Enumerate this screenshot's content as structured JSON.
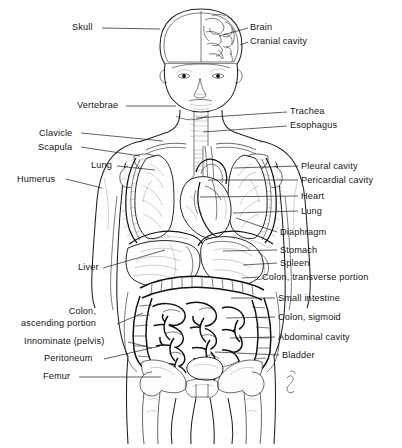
{
  "figure": {
    "orientation": "anterior view",
    "line_color": "#1c1c1c",
    "background_color": "#ffffff",
    "text_color": "#161616"
  },
  "labels_left": [
    {
      "id": "skull",
      "text": "Skull",
      "x": 72,
      "y": 22,
      "lead_to_x": 160,
      "lead_to_y": 29,
      "lead_from_x": 102,
      "lead_from_y": 28
    },
    {
      "id": "vertebrae",
      "text": "Vertebrae",
      "x": 77,
      "y": 100,
      "lead_to_x": 176,
      "lead_to_y": 106,
      "lead_from_x": 126,
      "lead_from_y": 106
    },
    {
      "id": "clavicle",
      "text": "Clavicle",
      "x": 39,
      "y": 128,
      "lead_to_x": 163,
      "lead_to_y": 141,
      "lead_from_x": 81,
      "lead_from_y": 133
    },
    {
      "id": "scapula",
      "text": "Scapula",
      "x": 38,
      "y": 142,
      "lead_to_x": 140,
      "lead_to_y": 156,
      "lead_from_x": 81,
      "lead_from_y": 147
    },
    {
      "id": "lung-left",
      "text": "Lung",
      "x": 91,
      "y": 160,
      "lead_to_x": 155,
      "lead_to_y": 170,
      "lead_from_x": 117,
      "lead_from_y": 166
    },
    {
      "id": "humerus",
      "text": "Humerus",
      "x": 17,
      "y": 174,
      "lead_to_x": 102,
      "lead_to_y": 188,
      "lead_from_x": 66,
      "lead_from_y": 179
    },
    {
      "id": "liver",
      "text": "Liver",
      "x": 78,
      "y": 262,
      "lead_to_x": 165,
      "lead_to_y": 250,
      "lead_from_x": 103,
      "lead_from_y": 268
    },
    {
      "id": "colon-ascending",
      "text": "Colon,\nascending portion",
      "x": 21,
      "y": 306,
      "lead_to_x": 143,
      "lead_to_y": 313,
      "lead_from_x": 117,
      "lead_from_y": 324
    },
    {
      "id": "innominate-pelvis",
      "text": "Innominate (pelvis)",
      "x": 24,
      "y": 336,
      "lead_to_x": 152,
      "lead_to_y": 348,
      "lead_from_x": 128,
      "lead_from_y": 342
    },
    {
      "id": "peritoneum",
      "text": "Peritoneum",
      "x": 44,
      "y": 353,
      "lead_to_x": 160,
      "lead_to_y": 346,
      "lead_from_x": 104,
      "lead_from_y": 359
    },
    {
      "id": "femur",
      "text": "Femur",
      "x": 43,
      "y": 371,
      "lead_to_x": 161,
      "lead_to_y": 377,
      "lead_from_x": 79,
      "lead_from_y": 377
    }
  ],
  "labels_right": [
    {
      "id": "brain",
      "text": "Brain",
      "x": 250,
      "y": 22,
      "lead_to_x": 219,
      "lead_to_y": 36,
      "lead_from_x": 248,
      "lead_from_y": 28
    },
    {
      "id": "cranial-cavity",
      "text": "Cranial cavity",
      "x": 250,
      "y": 36,
      "lead_to_x": 240,
      "lead_to_y": 45,
      "lead_from_x": 248,
      "lead_from_y": 42
    },
    {
      "id": "trachea",
      "text": "Trachea",
      "x": 290,
      "y": 106,
      "lead_to_x": 196,
      "lead_to_y": 118,
      "lead_from_x": 287,
      "lead_from_y": 112
    },
    {
      "id": "esophagus",
      "text": "Esophagus",
      "x": 290,
      "y": 120,
      "lead_to_x": 203,
      "lead_to_y": 132,
      "lead_from_x": 287,
      "lead_from_y": 126
    },
    {
      "id": "pleural-cavity",
      "text": "Pleural cavity",
      "x": 301,
      "y": 161,
      "lead_to_x": 234,
      "lead_to_y": 168,
      "lead_from_x": 298,
      "lead_from_y": 166
    },
    {
      "id": "pericardial-cavity",
      "text": "Pericardial cavity",
      "x": 301,
      "y": 175,
      "lead_to_x": 208,
      "lead_to_y": 180,
      "lead_from_x": 298,
      "lead_from_y": 180
    },
    {
      "id": "heart",
      "text": "Heart",
      "x": 301,
      "y": 191,
      "lead_to_x": 200,
      "lead_to_y": 197,
      "lead_from_x": 298,
      "lead_from_y": 196
    },
    {
      "id": "lung-right",
      "text": "Lung",
      "x": 301,
      "y": 206,
      "lead_to_x": 233,
      "lead_to_y": 213,
      "lead_from_x": 298,
      "lead_from_y": 211
    },
    {
      "id": "diaphragm",
      "text": "Diaphragm",
      "x": 280,
      "y": 227,
      "lead_to_x": 236,
      "lead_to_y": 218,
      "lead_from_x": 277,
      "lead_from_y": 232
    },
    {
      "id": "stomach",
      "text": "Stomach",
      "x": 280,
      "y": 245,
      "lead_to_x": 223,
      "lead_to_y": 251,
      "lead_from_x": 277,
      "lead_from_y": 250
    },
    {
      "id": "spleen",
      "text": "Spleen",
      "x": 280,
      "y": 258,
      "lead_to_x": 243,
      "lead_to_y": 265,
      "lead_from_x": 277,
      "lead_from_y": 263
    },
    {
      "id": "colon-transverse",
      "text": "Colon, transverse portion",
      "x": 262,
      "y": 272,
      "lead_to_x": 242,
      "lead_to_y": 278,
      "lead_from_x": 259,
      "lead_from_y": 277
    },
    {
      "id": "small-intestine",
      "text": "Small intestine",
      "x": 278,
      "y": 293,
      "lead_to_x": 231,
      "lead_to_y": 298,
      "lead_from_x": 275,
      "lead_from_y": 298
    },
    {
      "id": "colon-sigmoid",
      "text": "Colon, sigmoid",
      "x": 278,
      "y": 312,
      "lead_to_x": 226,
      "lead_to_y": 318,
      "lead_from_x": 275,
      "lead_from_y": 317
    },
    {
      "id": "abdominal-cavity",
      "text": "Abdominal cavity",
      "x": 278,
      "y": 332,
      "lead_to_x": 230,
      "lead_to_y": 338,
      "lead_from_x": 275,
      "lead_from_y": 337
    },
    {
      "id": "bladder",
      "text": "Bladder",
      "x": 282,
      "y": 350,
      "lead_to_x": 215,
      "lead_to_y": 352,
      "lead_from_x": 279,
      "lead_from_y": 355
    }
  ]
}
